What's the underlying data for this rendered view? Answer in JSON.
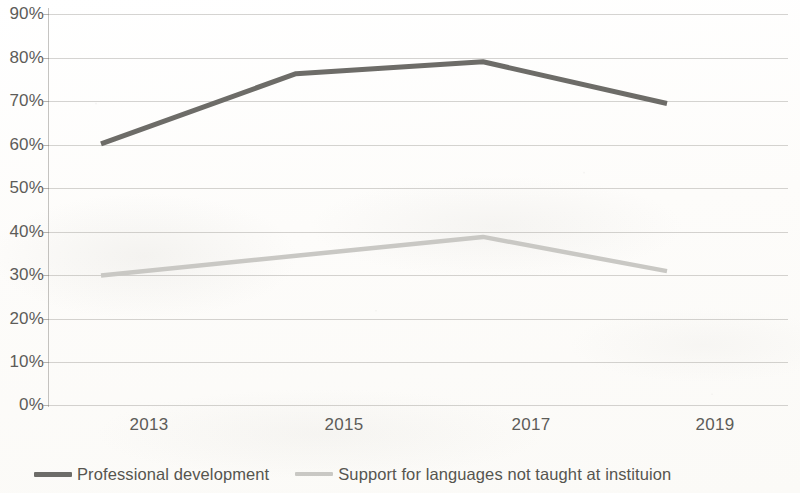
{
  "chart_data": {
    "type": "line",
    "title": "",
    "subtitle": "",
    "xlabel": "",
    "ylabel": "",
    "categories": [
      "2013",
      "2015",
      "2017",
      "2019"
    ],
    "x_tick_labels": [
      "2013",
      "2015",
      "2017",
      "2019"
    ],
    "y_tick_labels": [
      "90%",
      "80%",
      "70%",
      "60%",
      "50%",
      "40%",
      "30%",
      "20%",
      "10%",
      "0%"
    ],
    "y_tick_values": [
      90,
      80,
      70,
      60,
      50,
      40,
      30,
      20,
      10,
      0
    ],
    "ylim": [
      0,
      90
    ],
    "y_unit": "%",
    "grid": "horizontal",
    "legend_position": "bottom-left",
    "series": [
      {
        "name": "Professional development",
        "color": "#6d6c68",
        "values": [
          59.5,
          75.5,
          78.2,
          68.7
        ]
      },
      {
        "name": "Support for languages not taught at instituion",
        "color": "#c9c8c4",
        "values": [
          29.5,
          34.0,
          38.3,
          30.5
        ]
      }
    ]
  },
  "legend": {
    "items": [
      {
        "label": "Professional development",
        "marker": "line-swatch-dark",
        "color": "#6d6c68"
      },
      {
        "label": "Support for languages not taught at instituion",
        "marker": "line-swatch-light",
        "color": "#c9c8c4"
      }
    ]
  },
  "colors": {
    "background": "#fdfdfc",
    "gridline": "#96948f",
    "axis": "#96948f",
    "tick_label": "#5d5c59",
    "series_primary": "#6d6c68",
    "series_secondary": "#c9c8c4"
  }
}
